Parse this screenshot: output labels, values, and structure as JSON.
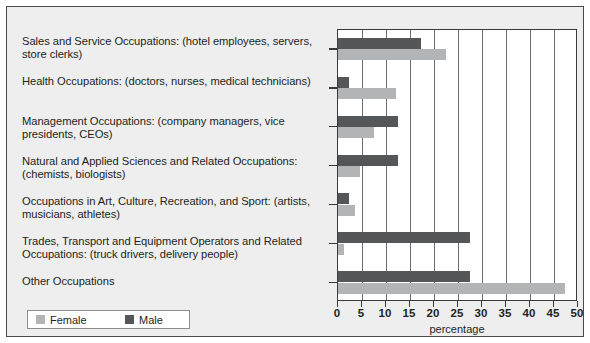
{
  "chart_data": {
    "type": "bar",
    "orientation": "horizontal",
    "title": "",
    "xlabel": "percentage",
    "ylabel": "",
    "xlim": [
      0,
      50
    ],
    "xticks": [
      0,
      5,
      10,
      15,
      20,
      25,
      30,
      35,
      40,
      45,
      50
    ],
    "grid": "vertical",
    "legend_position": "bottom-left",
    "categories": [
      "Sales and Service Occupations: (hotel employees, servers, store clerks)",
      "Health Occupations: (doctors, nurses, medical technicians)",
      "Management Occupations: (company managers, vice presidents, CEOs)",
      "Natural and Applied Sciences and Related Occupations: (chemists, biologists)",
      "Occupations in Art, Culture, Recreation, and Sport: (artists, musicians, athletes)",
      "Trades, Transport and Equipment Operators and Related Occupations: (truck drivers, delivery people)",
      "Other Occupations"
    ],
    "series": [
      {
        "name": "Male",
        "color": "#555657",
        "values": [
          17.3,
          2.2,
          12.4,
          12.4,
          2.3,
          27.5,
          27.5
        ]
      },
      {
        "name": "Female",
        "color": "#b3b4b5",
        "values": [
          22.5,
          12.0,
          7.6,
          4.6,
          3.5,
          1.2,
          47.3
        ]
      }
    ]
  },
  "legend": {
    "items": [
      {
        "label": "Female",
        "color": "#b3b4b5"
      },
      {
        "label": "Male",
        "color": "#555657"
      }
    ]
  },
  "axis": {
    "x_title": "percentage",
    "tick_labels": [
      "0",
      "5",
      "10",
      "15",
      "20",
      "25",
      "30",
      "35",
      "40",
      "45",
      "50"
    ]
  }
}
